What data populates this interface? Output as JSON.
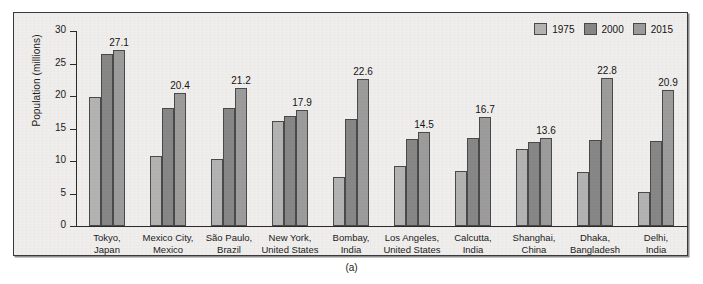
{
  "caption": "(a)",
  "legend": {
    "position": "top-right",
    "entries": [
      {
        "label": "1975",
        "color": "#b3b3b3",
        "key": "s1975"
      },
      {
        "label": "2000",
        "color": "#878787",
        "key": "s2000"
      },
      {
        "label": "2015",
        "color": "#9c9c9c",
        "key": "s2015"
      }
    ]
  },
  "chart_data": {
    "type": "bar",
    "title": "",
    "xlabel": "",
    "ylabel": "Population (millions)",
    "ylim": [
      0,
      30
    ],
    "yticks": [
      0,
      5,
      10,
      15,
      20,
      25,
      30
    ],
    "ytick_labels": [
      "0",
      "5",
      "10",
      "15",
      "20",
      "25",
      "30"
    ],
    "grid": false,
    "legend_position": "top-right",
    "categories": [
      "Tokyo, Japan",
      "Mexico City, Mexico",
      "São Paulo, Brazil",
      "New York, United States",
      "Bombay, India",
      "Los Angeles, United States",
      "Calcutta, India",
      "Shanghai, China",
      "Dhaka, Bangladesh",
      "Delhi, India"
    ],
    "category_lines": [
      [
        "Tokyo,",
        "Japan"
      ],
      [
        "Mexico City,",
        "Mexico"
      ],
      [
        "São Paulo,",
        "Brazil"
      ],
      [
        "New York,",
        "United States"
      ],
      [
        "Bombay,",
        "India"
      ],
      [
        "Los Angeles,",
        "United States"
      ],
      [
        "Calcutta,",
        "India"
      ],
      [
        "Shanghai,",
        "China"
      ],
      [
        "Dhaka,",
        "Bangladesh"
      ],
      [
        "Delhi,",
        "India"
      ]
    ],
    "series": [
      {
        "name": "1975",
        "color": "#b3b3b3",
        "values": [
          19.8,
          10.7,
          10.3,
          16.2,
          7.6,
          9.3,
          8.4,
          11.9,
          8.3,
          5.3
        ]
      },
      {
        "name": "2000",
        "color": "#878787",
        "values": [
          26.4,
          18.1,
          18.1,
          16.9,
          16.4,
          13.4,
          13.6,
          12.9,
          13.2,
          13.1
        ]
      },
      {
        "name": "2015",
        "color": "#9c9c9c",
        "values": [
          27.1,
          20.4,
          21.2,
          17.9,
          22.6,
          14.5,
          16.7,
          13.6,
          22.8,
          20.9
        ]
      }
    ],
    "value_labels": {
      "series": "2015",
      "values": [
        "27.1",
        "20.4",
        "21.2",
        "17.9",
        "22.6",
        "14.5",
        "16.7",
        "13.6",
        "22.8",
        "20.9"
      ]
    }
  }
}
